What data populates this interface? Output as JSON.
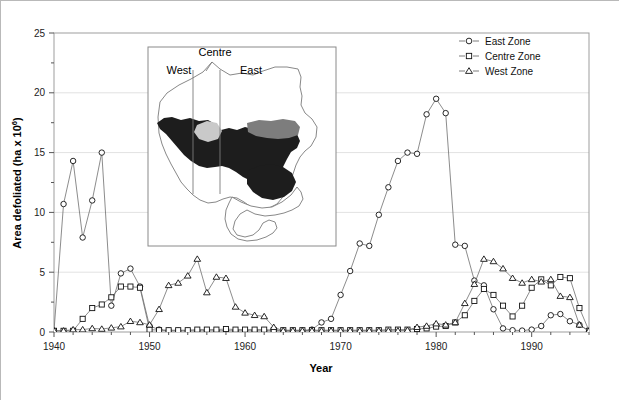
{
  "figure": {
    "background": "#ffffff",
    "border_color": "#b9b9b9"
  },
  "chart_data": {
    "type": "line",
    "title": "",
    "xlabel": "Year",
    "ylabel": "Area defoliated (ha x 10⁶)",
    "xlim": [
      1940,
      1996
    ],
    "ylim": [
      0,
      25
    ],
    "xticks": [
      1940,
      1950,
      1960,
      1970,
      1980,
      1990
    ],
    "yticks": [
      0,
      5,
      10,
      15,
      20,
      25
    ],
    "xminor_step": 2,
    "yminor_step": 2.5,
    "grid": "horizontal-major-light",
    "legend_position": "top-right",
    "marker_style": "open",
    "line_color": "#6e6e6e",
    "marker_edge_color": "#111111",
    "marker_face_color": "#ffffff",
    "series": [
      {
        "name": "East Zone",
        "marker": "circle",
        "x": [
          1940,
          1941,
          1942,
          1943,
          1944,
          1945,
          1946,
          1947,
          1948,
          1949,
          1950,
          1951,
          1952,
          1953,
          1954,
          1955,
          1956,
          1957,
          1958,
          1959,
          1960,
          1961,
          1962,
          1963,
          1964,
          1965,
          1966,
          1967,
          1968,
          1969,
          1970,
          1971,
          1972,
          1973,
          1974,
          1975,
          1976,
          1977,
          1978,
          1979,
          1980,
          1981,
          1982,
          1983,
          1984,
          1985,
          1986,
          1987,
          1988,
          1989,
          1990,
          1991,
          1992,
          1993,
          1994,
          1995,
          1996
        ],
        "values": [
          0.1,
          10.7,
          14.3,
          7.9,
          11.0,
          15.0,
          2.2,
          4.9,
          5.3,
          3.8,
          0.5,
          0.2,
          0.1,
          0.1,
          0.1,
          0.1,
          0.1,
          0.1,
          0.1,
          0.1,
          0.1,
          0.1,
          0.1,
          0.1,
          0.1,
          0.1,
          0.1,
          0.2,
          0.8,
          1.1,
          3.1,
          5.1,
          7.4,
          7.2,
          9.8,
          12.1,
          14.3,
          15.0,
          14.9,
          18.2,
          19.5,
          18.3,
          7.3,
          7.2,
          4.3,
          3.9,
          1.9,
          0.3,
          0.15,
          0.12,
          0.2,
          0.5,
          1.4,
          1.5,
          0.9,
          0.6,
          0.05
        ]
      },
      {
        "name": "Centre Zone",
        "marker": "square",
        "x": [
          1940,
          1941,
          1942,
          1943,
          1944,
          1945,
          1946,
          1947,
          1948,
          1949,
          1950,
          1951,
          1952,
          1953,
          1954,
          1955,
          1956,
          1957,
          1958,
          1959,
          1960,
          1961,
          1962,
          1963,
          1964,
          1965,
          1966,
          1967,
          1968,
          1969,
          1970,
          1971,
          1972,
          1973,
          1974,
          1975,
          1976,
          1977,
          1978,
          1979,
          1980,
          1981,
          1982,
          1983,
          1984,
          1985,
          1986,
          1987,
          1988,
          1989,
          1990,
          1991,
          1992,
          1993,
          1994,
          1995,
          1996
        ],
        "values": [
          0.1,
          0.1,
          0.1,
          1.1,
          2.0,
          2.3,
          2.9,
          3.8,
          3.8,
          3.7,
          0.2,
          0.15,
          0.15,
          0.15,
          0.15,
          0.2,
          0.2,
          0.2,
          0.25,
          0.2,
          0.2,
          0.2,
          0.2,
          0.15,
          0.15,
          0.15,
          0.15,
          0.15,
          0.15,
          0.15,
          0.15,
          0.15,
          0.15,
          0.15,
          0.15,
          0.2,
          0.2,
          0.2,
          0.25,
          0.3,
          0.45,
          0.5,
          0.8,
          1.4,
          2.6,
          3.6,
          3.1,
          2.2,
          1.3,
          2.2,
          3.7,
          4.4,
          3.9,
          4.6,
          4.5,
          2.0,
          0.1
        ]
      },
      {
        "name": "West Zone",
        "marker": "triangle",
        "x": [
          1940,
          1941,
          1942,
          1943,
          1944,
          1945,
          1946,
          1947,
          1948,
          1949,
          1950,
          1951,
          1952,
          1953,
          1954,
          1955,
          1956,
          1957,
          1958,
          1959,
          1960,
          1961,
          1962,
          1963,
          1964,
          1965,
          1966,
          1967,
          1968,
          1969,
          1970,
          1971,
          1972,
          1973,
          1974,
          1975,
          1976,
          1977,
          1978,
          1979,
          1980,
          1981,
          1982,
          1983,
          1984,
          1985,
          1986,
          1987,
          1988,
          1989,
          1990,
          1991,
          1992,
          1993,
          1994,
          1995,
          1996
        ],
        "values": [
          0.1,
          0.1,
          0.2,
          0.2,
          0.3,
          0.25,
          0.35,
          0.45,
          0.9,
          0.8,
          0.6,
          1.9,
          3.9,
          4.1,
          4.7,
          6.1,
          3.3,
          4.6,
          4.5,
          2.1,
          1.6,
          1.4,
          1.3,
          0.4,
          0.1,
          0.1,
          0.1,
          0.1,
          0.1,
          0.1,
          0.1,
          0.1,
          0.1,
          0.1,
          0.1,
          0.1,
          0.1,
          0.15,
          0.4,
          0.5,
          0.7,
          0.6,
          0.8,
          2.4,
          4.0,
          6.1,
          5.9,
          5.3,
          4.5,
          4.1,
          4.4,
          4.2,
          4.4,
          3.0,
          2.9,
          0.6,
          0.1
        ]
      }
    ]
  },
  "legend": {
    "items": [
      {
        "label": "East Zone",
        "marker": "circle"
      },
      {
        "label": "Centre Zone",
        "marker": "square"
      },
      {
        "label": "West Zone",
        "marker": "triangle"
      }
    ]
  },
  "inset": {
    "caption": "Map of Ontario showing defoliation zones",
    "labels": [
      {
        "text": "West",
        "x": 178,
        "y": 73
      },
      {
        "text": "Centre",
        "x": 214,
        "y": 55
      },
      {
        "text": "East",
        "x": 250,
        "y": 73
      }
    ],
    "border_color": "#8a8a8a",
    "fill_dark": "#1d1d1d",
    "fill_mid": "#7d7d7d",
    "fill_light": "#c9c9c9"
  }
}
